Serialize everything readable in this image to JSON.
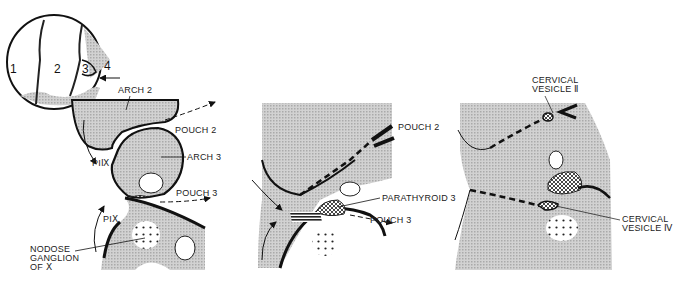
{
  "inset": {
    "numbers": [
      "1",
      "2",
      "3",
      "4"
    ]
  },
  "panel_left": {
    "labels": {
      "arch2": "ARCH 2",
      "pouch2": "POUCH 2",
      "arch3": "ARCH 3",
      "pi9": "PIⅨ",
      "pouch3": "POUCH 3",
      "pi10": "PIⅩ",
      "nodose_1": "NODOSE",
      "nodose_2": "GANGLION",
      "nodose_3": "OF Ⅹ"
    }
  },
  "panel_middle": {
    "labels": {
      "pouch2": "POUCH 2",
      "parathyroid": "PARATHYROID 3",
      "pouch3": "POUCH  3"
    }
  },
  "panel_right": {
    "labels": {
      "cv2_1": "CERVICAL",
      "cv2_2": "VESICLE Ⅱ",
      "cv4_1": "CERVICAL",
      "cv4_2": "VESICLE Ⅳ"
    }
  },
  "colors": {
    "tissue": "#c9c9c9",
    "ink": "#111111"
  }
}
